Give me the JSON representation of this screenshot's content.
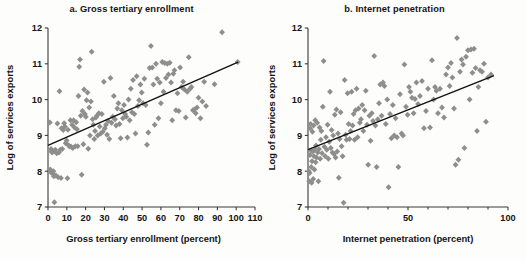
{
  "figure": {
    "background": "#fdfdfc",
    "marker_color": "#8e8e8e",
    "axis_color": "#3b3b3b",
    "trendline_color": "#111111"
  },
  "chart_data": [
    {
      "type": "scatter",
      "panel": "a",
      "title": "a. Gross tertiary enrollment",
      "xlabel": "Gross tertiary enrollment (percent)",
      "ylabel": "Log of services exports",
      "xlim": [
        0,
        110
      ],
      "ylim": [
        7,
        12
      ],
      "xticks": [
        0,
        10,
        20,
        30,
        40,
        50,
        60,
        70,
        80,
        90,
        100,
        110
      ],
      "xticklabels": [
        "0",
        "10",
        "20",
        "30",
        "40",
        "50",
        "60",
        "70",
        "80",
        "90",
        "100",
        "110"
      ],
      "yticks": [
        7,
        8,
        9,
        10,
        11,
        12
      ],
      "yticklabels": [
        "7",
        "8",
        "9",
        "10",
        "11",
        "12"
      ],
      "grid": false,
      "legend": "none",
      "marker": "diamond",
      "trendline": {
        "x0": 0,
        "y0": 8.72,
        "x1": 101,
        "y1": 11.05
      },
      "points": [
        [
          1.0,
          9.36
        ],
        [
          1.2,
          8.05
        ],
        [
          1.3,
          7.98
        ],
        [
          1.6,
          8.62
        ],
        [
          1.8,
          8.55
        ],
        [
          2.2,
          8.52
        ],
        [
          2.4,
          8.58
        ],
        [
          2.6,
          7.92
        ],
        [
          2.9,
          8.0
        ],
        [
          3.1,
          7.86
        ],
        [
          3.4,
          7.13
        ],
        [
          3.6,
          8.56
        ],
        [
          3.9,
          8.6
        ],
        [
          4.2,
          7.88
        ],
        [
          4.6,
          8.5
        ],
        [
          5.0,
          9.33
        ],
        [
          5.4,
          7.83
        ],
        [
          5.8,
          8.52
        ],
        [
          6.1,
          10.23
        ],
        [
          6.5,
          8.6
        ],
        [
          6.9,
          7.81
        ],
        [
          7.2,
          9.2
        ],
        [
          7.6,
          8.62
        ],
        [
          8.1,
          9.15
        ],
        [
          8.6,
          9.34
        ],
        [
          9.0,
          9.25
        ],
        [
          9.4,
          8.78
        ],
        [
          9.9,
          8.86
        ],
        [
          10.3,
          7.8
        ],
        [
          10.6,
          9.16
        ],
        [
          11.0,
          8.72
        ],
        [
          11.4,
          8.7
        ],
        [
          11.9,
          9.42
        ],
        [
          12.3,
          8.68
        ],
        [
          12.8,
          9.3
        ],
        [
          13.2,
          8.65
        ],
        [
          13.6,
          9.42
        ],
        [
          14.1,
          9.22
        ],
        [
          14.5,
          8.7
        ],
        [
          15.0,
          9.37
        ],
        [
          15.4,
          9.17
        ],
        [
          15.8,
          8.7
        ],
        [
          16.2,
          10.1
        ],
        [
          16.6,
          10.92
        ],
        [
          17.0,
          11.12
        ],
        [
          17.4,
          9.55
        ],
        [
          17.9,
          7.9
        ],
        [
          18.3,
          9.68
        ],
        [
          18.8,
          8.75
        ],
        [
          19.2,
          10.28
        ],
        [
          19.6,
          9.6
        ],
        [
          20.1,
          9.52
        ],
        [
          20.5,
          9.98
        ],
        [
          21.0,
          10.2
        ],
        [
          21.4,
          8.63
        ],
        [
          21.9,
          9.78
        ],
        [
          22.3,
          9.0
        ],
        [
          22.8,
          9.95
        ],
        [
          23.2,
          11.34
        ],
        [
          23.7,
          9.45
        ],
        [
          24.1,
          9.3
        ],
        [
          24.6,
          8.9
        ],
        [
          25.0,
          9.12
        ],
        [
          25.5,
          9.5
        ],
        [
          26.0,
          9.55
        ],
        [
          26.4,
          9.0
        ],
        [
          27.0,
          9.62
        ],
        [
          27.5,
          9.25
        ],
        [
          28.0,
          9.05
        ],
        [
          28.6,
          9.6
        ],
        [
          29.1,
          9.1
        ],
        [
          29.7,
          10.5
        ],
        [
          30.2,
          9.2
        ],
        [
          30.8,
          9.3
        ],
        [
          31.4,
          9.02
        ],
        [
          32.0,
          9.4
        ],
        [
          32.6,
          8.9
        ],
        [
          33.2,
          10.6
        ],
        [
          33.8,
          9.35
        ],
        [
          34.4,
          9.52
        ],
        [
          35.0,
          10.1
        ],
        [
          35.6,
          9.45
        ],
        [
          36.2,
          9.28
        ],
        [
          36.8,
          9.75
        ],
        [
          37.4,
          9.9
        ],
        [
          38.0,
          9.32
        ],
        [
          38.6,
          8.92
        ],
        [
          39.2,
          9.7
        ],
        [
          39.8,
          9.48
        ],
        [
          40.4,
          9.85
        ],
        [
          41.0,
          9.6
        ],
        [
          41.6,
          9.52
        ],
        [
          42.2,
          8.94
        ],
        [
          42.8,
          10.0
        ],
        [
          43.4,
          9.42
        ],
        [
          44.0,
          10.3
        ],
        [
          44.6,
          9.65
        ],
        [
          45.2,
          10.55
        ],
        [
          45.9,
          9.6
        ],
        [
          46.5,
          9.05
        ],
        [
          47.1,
          10.65
        ],
        [
          47.8,
          9.82
        ],
        [
          48.4,
          9.98
        ],
        [
          49.1,
          10.42
        ],
        [
          49.8,
          10.2
        ],
        [
          50.5,
          9.9
        ],
        [
          51.2,
          10.58
        ],
        [
          51.9,
          9.85
        ],
        [
          52.6,
          8.74
        ],
        [
          53.3,
          9.08
        ],
        [
          54.0,
          10.88
        ],
        [
          54.7,
          11.5
        ],
        [
          55.4,
          10.9
        ],
        [
          56.0,
          10.42
        ],
        [
          56.7,
          9.3
        ],
        [
          57.4,
          11.0
        ],
        [
          58.0,
          10.58
        ],
        [
          58.7,
          9.48
        ],
        [
          59.4,
          10.48
        ],
        [
          60.0,
          9.9
        ],
        [
          60.7,
          11.05
        ],
        [
          61.4,
          10.22
        ],
        [
          62.0,
          11.02
        ],
        [
          62.7,
          10.6
        ],
        [
          63.4,
          11.0
        ],
        [
          64.0,
          10.7
        ],
        [
          64.7,
          11.03
        ],
        [
          65.4,
          10.48
        ],
        [
          66.0,
          9.42
        ],
        [
          66.6,
          10.72
        ],
        [
          67.2,
          10.82
        ],
        [
          68.0,
          9.7
        ],
        [
          68.8,
          10.18
        ],
        [
          69.5,
          9.68
        ],
        [
          70.2,
          10.9
        ],
        [
          71.0,
          10.35
        ],
        [
          71.8,
          10.5
        ],
        [
          72.5,
          10.28
        ],
        [
          73.2,
          9.5
        ],
        [
          74.0,
          10.22
        ],
        [
          74.8,
          11.18
        ],
        [
          75.5,
          10.3
        ],
        [
          76.2,
          10.35
        ],
        [
          77.0,
          9.7
        ],
        [
          77.8,
          9.72
        ],
        [
          78.5,
          9.62
        ],
        [
          79.2,
          9.78
        ],
        [
          80.0,
          10.05
        ],
        [
          81.0,
          9.48
        ],
        [
          82.0,
          9.95
        ],
        [
          83.0,
          10.5
        ],
        [
          84.0,
          9.82
        ],
        [
          88.5,
          10.43
        ],
        [
          92.5,
          11.88
        ],
        [
          100.8,
          11.05
        ]
      ]
    },
    {
      "type": "scatter",
      "panel": "b",
      "title": "b. Internet penetration",
      "xlabel": "Internet penetration (percent)",
      "ylabel": "Log of services exports",
      "xlim": [
        0,
        100
      ],
      "ylim": [
        7,
        12
      ],
      "xticks": [
        0,
        50,
        100
      ],
      "xticklabels": [
        "0",
        "50",
        "100"
      ],
      "yticks": [
        7,
        8,
        9,
        10,
        11,
        12
      ],
      "yticklabels": [
        "7",
        "8",
        "9",
        "10",
        "11",
        "12"
      ],
      "grid": false,
      "legend": "none",
      "marker": "diamond",
      "trendline": {
        "x0": 0,
        "y0": 8.6,
        "x1": 93,
        "y1": 10.67
      },
      "points": [
        [
          0.4,
          8.0
        ],
        [
          0.6,
          7.72
        ],
        [
          0.8,
          7.95
        ],
        [
          1.0,
          8.45
        ],
        [
          1.1,
          9.2
        ],
        [
          1.3,
          9.32
        ],
        [
          1.5,
          8.58
        ],
        [
          1.6,
          8.12
        ],
        [
          1.8,
          7.68
        ],
        [
          2.0,
          8.28
        ],
        [
          2.2,
          9.1
        ],
        [
          2.4,
          8.55
        ],
        [
          2.6,
          7.78
        ],
        [
          2.8,
          9.28
        ],
        [
          3.0,
          8.42
        ],
        [
          3.2,
          8.05
        ],
        [
          3.4,
          8.6
        ],
        [
          3.6,
          9.42
        ],
        [
          3.8,
          8.25
        ],
        [
          4.0,
          8.72
        ],
        [
          4.3,
          8.38
        ],
        [
          4.6,
          9.35
        ],
        [
          4.9,
          8.52
        ],
        [
          5.2,
          7.72
        ],
        [
          5.5,
          8.62
        ],
        [
          5.8,
          9.22
        ],
        [
          6.1,
          8.35
        ],
        [
          6.4,
          8.88
        ],
        [
          6.7,
          9.12
        ],
        [
          7.0,
          8.5
        ],
        [
          7.4,
          9.8
        ],
        [
          7.8,
          11.08
        ],
        [
          8.2,
          8.68
        ],
        [
          8.6,
          8.42
        ],
        [
          9.0,
          8.95
        ],
        [
          9.4,
          8.6
        ],
        [
          9.8,
          9.3
        ],
        [
          10.2,
          8.35
        ],
        [
          10.6,
          8.82
        ],
        [
          11.0,
          10.22
        ],
        [
          11.4,
          8.65
        ],
        [
          11.8,
          9.15
        ],
        [
          12.2,
          8.52
        ],
        [
          12.6,
          9.0
        ],
        [
          13.0,
          8.48
        ],
        [
          13.4,
          9.58
        ],
        [
          13.8,
          8.38
        ],
        [
          14.2,
          9.72
        ],
        [
          14.6,
          8.55
        ],
        [
          15.0,
          9.05
        ],
        [
          15.4,
          7.82
        ],
        [
          15.8,
          8.9
        ],
        [
          16.3,
          9.65
        ],
        [
          16.8,
          8.7
        ],
        [
          17.3,
          8.42
        ],
        [
          17.8,
          7.12
        ],
        [
          18.3,
          10.55
        ],
        [
          18.8,
          9.02
        ],
        [
          19.3,
          8.88
        ],
        [
          19.8,
          10.18
        ],
        [
          20.3,
          9.32
        ],
        [
          20.8,
          8.9
        ],
        [
          21.3,
          9.12
        ],
        [
          21.8,
          10.22
        ],
        [
          22.3,
          9.28
        ],
        [
          22.8,
          9.6
        ],
        [
          23.3,
          8.88
        ],
        [
          23.8,
          9.7
        ],
        [
          24.3,
          10.3
        ],
        [
          24.8,
          8.95
        ],
        [
          25.3,
          9.75
        ],
        [
          25.9,
          9.35
        ],
        [
          26.5,
          9.45
        ],
        [
          27.1,
          9.85
        ],
        [
          27.7,
          9.12
        ],
        [
          28.3,
          9.7
        ],
        [
          28.9,
          10.25
        ],
        [
          29.5,
          9.3
        ],
        [
          30.1,
          8.18
        ],
        [
          30.7,
          9.55
        ],
        [
          31.3,
          8.85
        ],
        [
          31.9,
          9.62
        ],
        [
          32.5,
          9.4
        ],
        [
          33.1,
          11.22
        ],
        [
          33.7,
          9.28
        ],
        [
          34.3,
          8.12
        ],
        [
          34.9,
          9.45
        ],
        [
          35.5,
          9.9
        ],
        [
          36.1,
          10.42
        ],
        [
          36.8,
          9.55
        ],
        [
          37.5,
          10.48
        ],
        [
          38.2,
          10.38
        ],
        [
          38.9,
          9.32
        ],
        [
          39.6,
          10.0
        ],
        [
          40.3,
          7.55
        ],
        [
          41.0,
          9.6
        ],
        [
          41.7,
          8.92
        ],
        [
          42.4,
          9.85
        ],
        [
          43.1,
          9.0
        ],
        [
          43.8,
          9.48
        ],
        [
          44.5,
          8.95
        ],
        [
          45.2,
          8.12
        ],
        [
          46.0,
          10.15
        ],
        [
          46.8,
          9.05
        ],
        [
          47.5,
          9.0
        ],
        [
          48.2,
          10.98
        ],
        [
          49.0,
          9.8
        ],
        [
          49.8,
          9.58
        ],
        [
          50.5,
          10.35
        ],
        [
          51.2,
          10.22
        ],
        [
          52.0,
          10.05
        ],
        [
          52.8,
          9.62
        ],
        [
          53.5,
          10.02
        ],
        [
          54.2,
          10.48
        ],
        [
          55.0,
          9.88
        ],
        [
          56.0,
          10.1
        ],
        [
          57.0,
          10.52
        ],
        [
          58.0,
          9.2
        ],
        [
          59.0,
          9.68
        ],
        [
          60.0,
          10.3
        ],
        [
          61.0,
          9.22
        ],
        [
          62.0,
          11.1
        ],
        [
          62.8,
          10.0
        ],
        [
          63.5,
          10.35
        ],
        [
          64.2,
          10.25
        ],
        [
          65.0,
          9.62
        ],
        [
          66.0,
          10.3
        ],
        [
          67.0,
          9.78
        ],
        [
          68.0,
          9.5
        ],
        [
          69.0,
          10.7
        ],
        [
          70.0,
          10.9
        ],
        [
          70.8,
          10.38
        ],
        [
          71.5,
          11.02
        ],
        [
          72.2,
          10.62
        ],
        [
          73.0,
          9.75
        ],
        [
          73.8,
          8.18
        ],
        [
          74.5,
          11.72
        ],
        [
          75.2,
          8.32
        ],
        [
          76.0,
          10.78
        ],
        [
          76.8,
          11.12
        ],
        [
          77.5,
          10.98
        ],
        [
          78.2,
          8.65
        ],
        [
          79.0,
          11.2
        ],
        [
          80.0,
          11.38
        ],
        [
          80.8,
          10.0
        ],
        [
          81.5,
          11.4
        ],
        [
          82.2,
          10.75
        ],
        [
          83.0,
          11.42
        ],
        [
          83.8,
          10.88
        ],
        [
          84.5,
          9.12
        ],
        [
          85.2,
          10.35
        ],
        [
          86.0,
          10.82
        ],
        [
          87.0,
          10.78
        ],
        [
          88.0,
          11.0
        ],
        [
          89.0,
          9.38
        ],
        [
          90.0,
          10.62
        ],
        [
          91.5,
          10.7
        ]
      ]
    }
  ]
}
